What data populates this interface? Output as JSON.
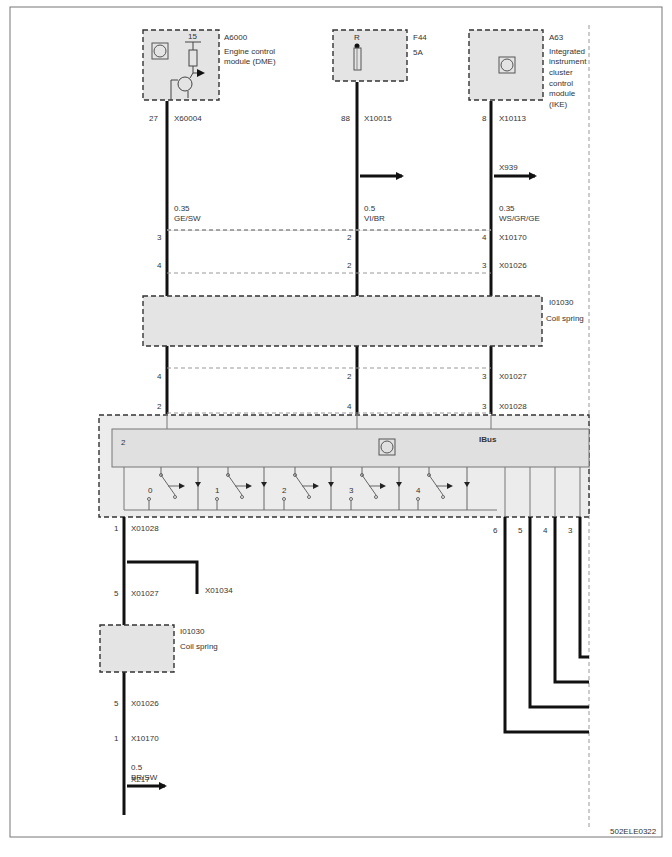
{
  "diagram": {
    "figure_id": "502ELE0322",
    "components": {
      "dme": {
        "id": "A6000",
        "name_line1": "Engine control",
        "name_line2": "module (DME)",
        "terminal": "15",
        "pin": "27",
        "connector": "X60004"
      },
      "fuse": {
        "id": "F44",
        "rating": "5A",
        "terminal": "R",
        "pin": "88",
        "connector": "X10015"
      },
      "ike": {
        "id": "A63",
        "name_lines": [
          "Integrated",
          "instrument",
          "cluster",
          "control",
          "module",
          "(IKE)"
        ],
        "pin": "8",
        "connector": "X10113"
      },
      "coil_spring_top": {
        "id": "I01030",
        "name": "Coil spring"
      },
      "coil_spring_bottom": {
        "id": "I01030",
        "name": "Coil spring"
      },
      "switch_module": {
        "label": "IBus",
        "pin_left": "2",
        "switch_labels": [
          "0",
          "1",
          "2",
          "3",
          "4"
        ]
      }
    },
    "wires": {
      "w1": {
        "gauge": "0.35",
        "color": "GE/SW"
      },
      "w2": {
        "gauge": "0.5",
        "color": "VI/BR"
      },
      "w3": {
        "gauge": "0.35",
        "color": "WS/GR/GE",
        "splice": "X939"
      },
      "w4": {
        "gauge": "0.5",
        "color": "BR/SW",
        "splice": "X217"
      }
    },
    "connectors": {
      "x10170": {
        "name": "X10170",
        "pins": [
          "3",
          "2",
          "4"
        ]
      },
      "x01026": {
        "name": "X01026",
        "pins": [
          "4",
          "2",
          "3"
        ]
      },
      "x01027": {
        "name": "X01027",
        "pins": [
          "4",
          "2",
          "3"
        ]
      },
      "x01028": {
        "name": "X01028",
        "pins": [
          "2",
          "4",
          "3"
        ]
      },
      "bottom_x01028": {
        "name": "X01028",
        "pin": "1"
      },
      "bottom_x01027": {
        "name": "X01027",
        "pin": "5"
      },
      "ground": {
        "name": "X01034"
      },
      "bottom_x01026": {
        "name": "X01026",
        "pin": "5"
      },
      "bottom_x10170": {
        "name": "X10170",
        "pin": "1"
      },
      "right_pins": [
        "6",
        "5",
        "4",
        "3"
      ]
    }
  }
}
